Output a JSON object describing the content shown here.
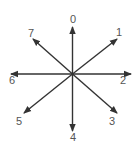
{
  "diagram": {
    "type": "compass-directions",
    "center": {
      "x": 72.5,
      "y": 74
    },
    "colors": {
      "arrow": "#333333",
      "label": "#555555",
      "background": "#ffffff"
    },
    "directions": [
      {
        "label": "0",
        "tip": {
          "x": 72.5,
          "y": 27
        },
        "label_pos": {
          "x": 73,
          "y": 23
        }
      },
      {
        "label": "1",
        "tip": {
          "x": 117,
          "y": 39
        },
        "label_pos": {
          "x": 119,
          "y": 36
        }
      },
      {
        "label": "2",
        "tip": {
          "x": 131,
          "y": 74
        },
        "label_pos": {
          "x": 123,
          "y": 84
        }
      },
      {
        "label": "3",
        "tip": {
          "x": 117,
          "y": 113
        },
        "label_pos": {
          "x": 112,
          "y": 125
        }
      },
      {
        "label": "4",
        "tip": {
          "x": 72.5,
          "y": 131
        },
        "label_pos": {
          "x": 73,
          "y": 141
        }
      },
      {
        "label": "5",
        "tip": {
          "x": 24,
          "y": 113
        },
        "label_pos": {
          "x": 19,
          "y": 125
        }
      },
      {
        "label": "6",
        "tip": {
          "x": 11,
          "y": 74
        },
        "label_pos": {
          "x": 12,
          "y": 84
        }
      },
      {
        "label": "7",
        "tip": {
          "x": 33,
          "y": 39
        },
        "label_pos": {
          "x": 31,
          "y": 37
        }
      }
    ]
  }
}
